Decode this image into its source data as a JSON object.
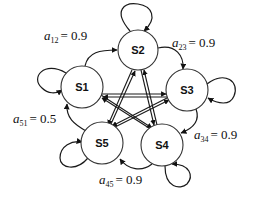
{
  "diagram": {
    "type": "state-transition-graph",
    "nodes": [
      {
        "id": "S1",
        "label": "S1",
        "cx": 82,
        "cy": 87
      },
      {
        "id": "S2",
        "label": "S2",
        "cx": 138,
        "cy": 50
      },
      {
        "id": "S3",
        "label": "S3",
        "cx": 187,
        "cy": 90
      },
      {
        "id": "S4",
        "label": "S4",
        "cx": 162,
        "cy": 145
      },
      {
        "id": "S5",
        "label": "S5",
        "cx": 102,
        "cy": 143
      }
    ],
    "edge_labels": {
      "a12": {
        "var": "a",
        "sub": "12",
        "value": "= 0.9"
      },
      "a23": {
        "var": "a",
        "sub": "23",
        "value": "= 0.9"
      },
      "a34": {
        "var": "a",
        "sub": "34",
        "value": "= 0.9"
      },
      "a45": {
        "var": "a",
        "sub": "45",
        "value": "= 0.9"
      },
      "a51": {
        "var": "a",
        "sub": "51",
        "value": "= 0.5"
      }
    },
    "edges": [
      {
        "from": "S1",
        "to": "S2",
        "label": "a12 = 0.9"
      },
      {
        "from": "S2",
        "to": "S3",
        "label": "a23 = 0.9"
      },
      {
        "from": "S3",
        "to": "S4",
        "label": "a34 = 0.9"
      },
      {
        "from": "S4",
        "to": "S5",
        "label": "a45 = 0.9"
      },
      {
        "from": "S5",
        "to": "S1",
        "label": "a51 = 0.5"
      }
    ],
    "self_loops": [
      "S1",
      "S2",
      "S3",
      "S4",
      "S5"
    ],
    "inner_star": "fully connected pentagram between all states"
  }
}
